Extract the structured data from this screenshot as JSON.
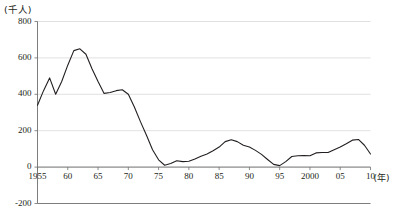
{
  "chart_data": {
    "type": "line",
    "title": "",
    "xlabel": "(年)",
    "ylabel": "(千人)",
    "unit_label": "(千人)",
    "xaxis_unit": "(年)",
    "ylim": [
      -200,
      800
    ],
    "xlim": [
      1955,
      2010
    ],
    "grid": true,
    "legend": "none",
    "yticks": [
      800,
      600,
      400,
      200,
      0,
      -200
    ],
    "ytick_labels": [
      "800",
      "600",
      "400",
      "200",
      "0",
      "-200"
    ],
    "xticks": [
      1955,
      1960,
      1965,
      1970,
      1975,
      1980,
      1985,
      1990,
      1995,
      2000,
      2005,
      2010
    ],
    "xtick_labels": [
      "1955",
      "60",
      "65",
      "70",
      "75",
      "80",
      "85",
      "90",
      "95",
      "2000",
      "05",
      "10"
    ],
    "line_color": "#231f20",
    "grid_color": "#d9d9d9",
    "axis_color": "#6e6e6e",
    "x": [
      1955,
      1956,
      1957,
      1958,
      1959,
      1960,
      1961,
      1962,
      1963,
      1964,
      1965,
      1966,
      1967,
      1968,
      1969,
      1970,
      1971,
      1972,
      1973,
      1974,
      1975,
      1976,
      1977,
      1978,
      1979,
      1980,
      1981,
      1982,
      1983,
      1984,
      1985,
      1986,
      1987,
      1988,
      1989,
      1990,
      1991,
      1992,
      1993,
      1994,
      1995,
      1996,
      1997,
      1998,
      1999,
      2000,
      2001,
      2002,
      2003,
      2004,
      2005,
      2006,
      2007,
      2008,
      2009,
      2010
    ],
    "values": [
      340,
      420,
      490,
      400,
      470,
      560,
      640,
      650,
      620,
      540,
      470,
      405,
      410,
      420,
      425,
      400,
      330,
      250,
      175,
      95,
      40,
      10,
      20,
      35,
      30,
      32,
      45,
      60,
      72,
      90,
      110,
      140,
      150,
      140,
      120,
      110,
      92,
      70,
      42,
      15,
      8,
      30,
      58,
      62,
      63,
      62,
      78,
      80,
      80,
      95,
      110,
      128,
      148,
      152,
      120,
      72
    ],
    "series_name": "人口増減数"
  }
}
